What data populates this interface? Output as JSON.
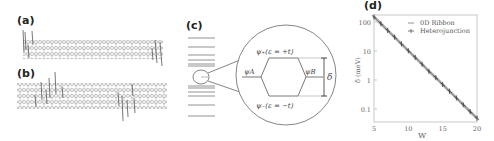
{
  "panels": {
    "a": {
      "label": "(a)",
      "description": "zigzag nanoribbon segment"
    },
    "b": {
      "label": "(b)",
      "description": "heterojunction nanoribbon"
    },
    "c": {
      "label": "(c)",
      "psi_plus": "ψ₊(ε = +t)",
      "psi_minus": "ψ₋(ε = −t)",
      "psi_A": "ψA",
      "psi_B": "ψB",
      "delta": "δ"
    },
    "d": {
      "label": "(d)"
    }
  },
  "chart_data": {
    "type": "line",
    "title": "",
    "xlabel": "W",
    "ylabel": "δ (meV)",
    "xlim": [
      5,
      20
    ],
    "ylim": [
      0.04,
      200
    ],
    "yscale": "log",
    "xticks": [
      "5",
      "10",
      "15",
      "20"
    ],
    "yticks": [
      "0.1",
      "1",
      "10",
      "100"
    ],
    "grid": false,
    "legend_position": "upper right",
    "x": [
      5,
      6,
      7,
      8,
      9,
      10,
      11,
      12,
      13,
      14,
      15,
      16,
      17,
      18,
      19,
      20
    ],
    "series": [
      {
        "name": "0D Ribbon",
        "values": [
          150,
          88,
          51,
          30,
          17.5,
          10.2,
          6.0,
          3.5,
          2.0,
          1.2,
          0.7,
          0.41,
          0.24,
          0.14,
          0.081,
          0.048
        ]
      },
      {
        "name": "Heterojunction",
        "values": [
          150,
          88,
          51,
          30,
          17.5,
          10.2,
          6.0,
          3.5,
          2.0,
          1.2,
          0.7,
          0.41,
          0.24,
          0.14,
          0.081,
          0.048
        ]
      }
    ]
  }
}
